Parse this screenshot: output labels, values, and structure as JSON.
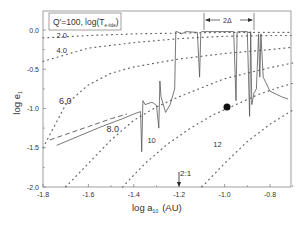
{
  "chart_data": {
    "type": "line",
    "title": "",
    "xlabel": "log a",
    "xlabel_sub": "10",
    "xlabel_unit": "(AU)",
    "ylabel": "log e",
    "ylabel_sub": "1",
    "xlim": [
      -1.8,
      -0.7
    ],
    "ylim": [
      -2.0,
      0.15
    ],
    "xticks": [
      -1.8,
      -1.6,
      -1.4,
      -1.2,
      -1.0,
      -0.8
    ],
    "xtick_labels": [
      "-1.8",
      "-1.6",
      "-1.4",
      "-1.2",
      "-1.0",
      "-0.8"
    ],
    "yticks": [
      0.0,
      -0.5,
      -1.0,
      -1.5,
      -2.0
    ],
    "ytick_labels": [
      "0.0",
      "-0.5",
      "-1.0",
      "-1.5",
      "-2.0"
    ],
    "grid": false,
    "legend": {
      "text": "Q'=100,  log(T",
      "sub": "e-tide",
      "close": ")",
      "position": "top-left"
    },
    "annotations": {
      "delta_label": "2Δ",
      "delta_range": [
        -1.22,
        -0.88
      ],
      "resonance_label": "2:1",
      "resonance_x": -1.2,
      "marker_point": {
        "x": -0.99,
        "y": -0.98
      }
    },
    "contour_labels": [
      {
        "text": "2.0",
        "x": -1.74,
        "y": -0.07
      },
      {
        "text": "4.0",
        "x": -1.74,
        "y": -0.25
      },
      {
        "text": "6.0",
        "x": -1.73,
        "y": -0.9
      },
      {
        "text": "8.0",
        "x": -1.52,
        "y": -1.26
      },
      {
        "text": "10",
        "x": -1.34,
        "y": -1.4
      },
      {
        "text": "12",
        "x": -1.05,
        "y": -1.45
      }
    ],
    "series": [
      {
        "name": "log(T_e-tide)=2.0",
        "style": "dotted",
        "x": [
          -1.8,
          -1.6,
          -1.4,
          -1.2,
          -1.0,
          -0.8,
          -0.7
        ],
        "y": [
          -0.1,
          -0.07,
          -0.05,
          -0.04,
          -0.03,
          -0.03,
          -0.03
        ]
      },
      {
        "name": "log(T_e-tide)=4.0",
        "style": "dotted",
        "x": [
          -1.8,
          -1.6,
          -1.4,
          -1.2,
          -1.0,
          -0.8,
          -0.7
        ],
        "y": [
          -0.4,
          -0.23,
          -0.16,
          -0.11,
          -0.08,
          -0.07,
          -0.07
        ]
      },
      {
        "name": "log(T_e-tide)=6.0",
        "style": "dotted",
        "x": [
          -1.8,
          -1.7,
          -1.6,
          -1.5,
          -1.4,
          -1.2,
          -1.0,
          -0.8,
          -0.7
        ],
        "y": [
          -1.5,
          -0.95,
          -0.7,
          -0.55,
          -0.47,
          -0.37,
          -0.3,
          -0.25,
          -0.22
        ]
      },
      {
        "name": "log(T_e-tide)=8.0",
        "style": "dotted",
        "x": [
          -1.7,
          -1.6,
          -1.5,
          -1.4,
          -1.3,
          -1.2,
          -1.0,
          -0.8,
          -0.7
        ],
        "y": [
          -2.0,
          -1.7,
          -1.4,
          -1.15,
          -0.98,
          -0.85,
          -0.62,
          -0.48,
          -0.42
        ]
      },
      {
        "name": "log(T_e-tide)=10",
        "style": "dotted",
        "x": [
          -1.45,
          -1.35,
          -1.25,
          -1.15,
          -1.05,
          -0.95,
          -0.85,
          -0.75,
          -0.7
        ],
        "y": [
          -2.0,
          -1.7,
          -1.45,
          -1.25,
          -1.08,
          -0.95,
          -0.82,
          -0.72,
          -0.68
        ]
      },
      {
        "name": "log(T_e-tide)=12",
        "style": "dotted",
        "x": [
          -1.1,
          -1.0,
          -0.9,
          -0.8,
          -0.7
        ],
        "y": [
          -2.0,
          -1.7,
          -1.42,
          -1.2,
          -1.02
        ]
      },
      {
        "name": "analytic",
        "style": "dashed",
        "x": [
          -1.77,
          -1.7,
          -1.6,
          -1.5,
          -1.43
        ],
        "y": [
          -1.4,
          -1.33,
          -1.23,
          -1.13,
          -1.07
        ]
      },
      {
        "name": "numerical",
        "style": "solid",
        "x": [
          -1.74,
          -1.65,
          -1.55,
          -1.45,
          -1.4,
          -1.37,
          -1.365,
          -1.36,
          -1.35,
          -1.32,
          -1.3,
          -1.29,
          -1.285,
          -1.28,
          -1.26,
          -1.24,
          -1.22,
          -1.215,
          -1.21,
          -1.19,
          -1.17,
          -1.12,
          -1.11,
          -1.105,
          -1.1,
          -1.09,
          -1.07,
          -1.05,
          -1.0,
          -0.96,
          -0.95,
          -0.945,
          -0.94,
          -0.93,
          -0.9,
          -0.89,
          -0.885,
          -0.88,
          -0.87,
          -0.86,
          -0.85,
          -0.845,
          -0.84,
          -0.83,
          -0.8,
          -0.75,
          -0.72
        ],
        "y": [
          -1.47,
          -1.36,
          -1.24,
          -1.13,
          -1.07,
          -1.04,
          -1.55,
          -0.9,
          -0.95,
          -0.92,
          -0.96,
          -1.25,
          -0.65,
          -0.85,
          -1.05,
          -0.95,
          -0.75,
          -0.02,
          -0.02,
          -0.05,
          -0.02,
          -0.03,
          -0.6,
          -0.03,
          -0.02,
          -0.02,
          -0.02,
          -0.02,
          -0.02,
          -0.02,
          -0.9,
          -0.03,
          -0.02,
          -0.02,
          -0.02,
          -1.1,
          -0.02,
          -0.95,
          -0.8,
          -0.75,
          -0.05,
          -0.6,
          -0.05,
          -0.6,
          -0.78,
          -0.85,
          -0.88
        ]
      }
    ]
  }
}
